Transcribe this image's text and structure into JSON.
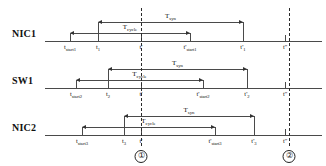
{
  "figure": {
    "type": "timing-diagram",
    "rows": [
      {
        "name": "NIC1",
        "label": "NIC1",
        "baseline_y": 41,
        "ticks": [
          {
            "name": "t-start1",
            "x": 70,
            "label": "t",
            "sub": "start1",
            "prime": "",
            "side": "up"
          },
          {
            "name": "t-1",
            "x": 98,
            "label": "t",
            "sub": "1",
            "prime": "",
            "side": "up"
          },
          {
            "name": "t-prime",
            "x": 141,
            "label": "t",
            "sub": "",
            "prime": "'",
            "side": "up"
          },
          {
            "name": "t-prime-start1",
            "x": 190,
            "label": "t",
            "sub": "start1",
            "prime": "'",
            "side": "up"
          },
          {
            "name": "t-prime-1",
            "x": 243,
            "label": "t",
            "sub": "1",
            "prime": "'",
            "side": "up"
          },
          {
            "name": "t-double-prime",
            "x": 285,
            "label": "t",
            "sub": "",
            "prime": "''",
            "side": "up"
          }
        ],
        "spans": [
          {
            "name": "t-syn",
            "label": "T",
            "sub": "syn",
            "x1": 98,
            "x2": 243,
            "y": 22
          },
          {
            "name": "t-cycle",
            "label": "T",
            "sub": "cycle",
            "x1": 70,
            "x2": 190,
            "y": 33
          }
        ]
      },
      {
        "name": "SW1",
        "label": "SW1",
        "baseline_y": 88,
        "ticks": [
          {
            "name": "t-start2",
            "x": 76,
            "label": "t",
            "sub": "start2",
            "prime": "",
            "side": "up"
          },
          {
            "name": "t-2",
            "x": 108,
            "label": "t",
            "sub": "2",
            "prime": "",
            "side": "up"
          },
          {
            "name": "t-prime",
            "x": 141,
            "label": "t",
            "sub": "",
            "prime": "'",
            "side": "up"
          },
          {
            "name": "t-prime-start2",
            "x": 203,
            "label": "t",
            "sub": "start2",
            "prime": "'",
            "side": "up"
          },
          {
            "name": "t-prime-2",
            "x": 247,
            "label": "t",
            "sub": "2",
            "prime": "'",
            "side": "up"
          },
          {
            "name": "t-double-prime",
            "x": 285,
            "label": "t",
            "sub": "",
            "prime": "''",
            "side": "up"
          }
        ],
        "spans": [
          {
            "name": "t-syn",
            "label": "T",
            "sub": "syn",
            "x1": 108,
            "x2": 247,
            "y": 69
          },
          {
            "name": "t-cycle",
            "label": "T",
            "sub": "cycle",
            "x1": 76,
            "x2": 203,
            "y": 80
          }
        ]
      },
      {
        "name": "NIC2",
        "label": "NIC2",
        "baseline_y": 135,
        "ticks": [
          {
            "name": "t-start3",
            "x": 82,
            "label": "t",
            "sub": "start3",
            "prime": "",
            "side": "up"
          },
          {
            "name": "t-3",
            "x": 124,
            "label": "t",
            "sub": "3",
            "prime": "",
            "side": "up"
          },
          {
            "name": "t-prime",
            "x": 141,
            "label": "t",
            "sub": "",
            "prime": "'",
            "side": "up"
          },
          {
            "name": "t-prime-start3",
            "x": 215,
            "label": "t",
            "sub": "start3",
            "prime": "'",
            "side": "up"
          },
          {
            "name": "t-prime-3",
            "x": 254,
            "label": "t",
            "sub": "3",
            "prime": "'",
            "side": "up"
          },
          {
            "name": "t-double-prime",
            "x": 285,
            "label": "t",
            "sub": "",
            "prime": "''",
            "side": "up"
          }
        ],
        "spans": [
          {
            "name": "t-syn",
            "label": "T",
            "sub": "syn",
            "x1": 124,
            "x2": 254,
            "y": 116
          },
          {
            "name": "t-cycle",
            "label": "T",
            "sub": "cycle",
            "x1": 82,
            "x2": 215,
            "y": 127
          }
        ]
      }
    ],
    "vertical_dashed_lines": [
      {
        "name": "dashed-line-t-prime",
        "x": 141,
        "y1": 8,
        "y2": 146,
        "marker": "①"
      },
      {
        "name": "dashed-line-t-double-prime",
        "x": 289,
        "y1": 8,
        "y2": 146,
        "marker": "②"
      }
    ],
    "markers": [
      {
        "name": "circled-marker-1",
        "x": 141,
        "y": 150,
        "text": "①"
      },
      {
        "name": "circled-marker-2",
        "x": 289,
        "y": 150,
        "text": "②"
      }
    ],
    "baseline_x1": 45,
    "baseline_x2": 322,
    "label_x": 12,
    "colors": {
      "line": "#4a4a4a",
      "dash": "#2b2b2b",
      "text": "#111111",
      "background": "#ffffff"
    }
  }
}
